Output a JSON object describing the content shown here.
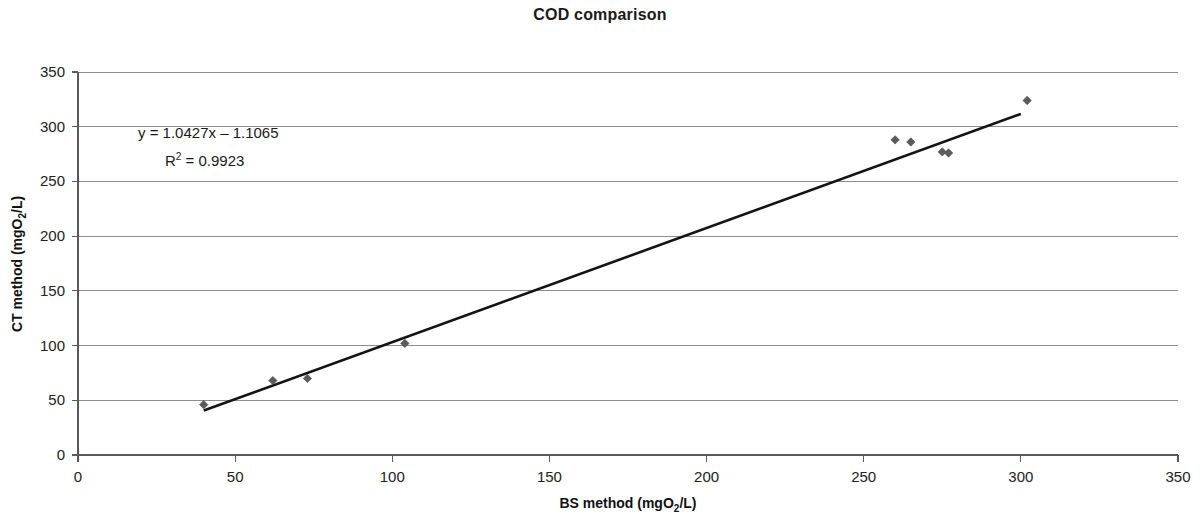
{
  "chart_data": {
    "type": "scatter",
    "title": "COD comparison",
    "xlabel": "BS method (mgO2/L)",
    "xlabel_parts": {
      "pre": "BS method (mgO",
      "sub": "2",
      "post": "/L)"
    },
    "ylabel": "CT method (mgO2/L)",
    "ylabel_parts": {
      "pre": "CT method (mgO",
      "sub": "2",
      "post": "/L)"
    },
    "xlim": [
      0,
      350
    ],
    "ylim": [
      0,
      350
    ],
    "xticks": [
      0,
      50,
      100,
      150,
      200,
      250,
      300,
      350
    ],
    "yticks": [
      0,
      50,
      100,
      150,
      200,
      250,
      300,
      350
    ],
    "xtick_labels": [
      "0",
      "50",
      "100",
      "150",
      "200",
      "250",
      "300",
      "350"
    ],
    "ytick_labels": [
      "0",
      "50",
      "100",
      "150",
      "200",
      "250",
      "300",
      "350"
    ],
    "grid": "horizontal",
    "legend": "none",
    "marker_color": "#5b5b5b",
    "line_color": "#141414",
    "points": [
      {
        "x": 40,
        "y": 46
      },
      {
        "x": 62,
        "y": 68
      },
      {
        "x": 73,
        "y": 70
      },
      {
        "x": 104,
        "y": 102
      },
      {
        "x": 260,
        "y": 288
      },
      {
        "x": 265,
        "y": 286
      },
      {
        "x": 275,
        "y": 277
      },
      {
        "x": 277,
        "y": 276
      },
      {
        "x": 302,
        "y": 324
      }
    ],
    "trendline": {
      "slope": 1.0427,
      "intercept": -1.1065,
      "x_start": 40,
      "x_end": 300
    },
    "annotations": {
      "equation": "y = 1.0427x – 1.1065",
      "r_squared_parts": {
        "pre": "R",
        "sup": "2",
        "post": " = 0.9923"
      },
      "r_squared": "R2 = 0.9923"
    }
  }
}
